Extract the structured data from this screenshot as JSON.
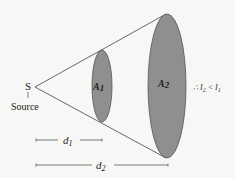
{
  "diagram": {
    "source_symbol": "S",
    "source_label": "Source",
    "area1_label": "A",
    "area1_sub": "1",
    "area2_label": "A",
    "area2_sub": "2",
    "d1_label": "d",
    "d1_sub": "1",
    "d2_label": "d",
    "d2_sub": "2",
    "conclusion_prefix": "∴ I",
    "conclusion_sub_a": "2",
    "conclusion_mid": " < I",
    "conclusion_sub_b": "1",
    "colors": {
      "ellipse_fill": "#8f8f8f",
      "ellipse_stroke": "#555555",
      "line": "#444444",
      "background": "#f7f7f5",
      "text": "#222222"
    }
  }
}
